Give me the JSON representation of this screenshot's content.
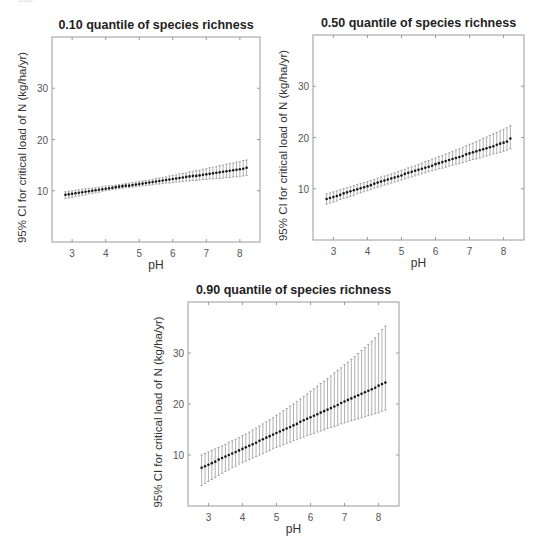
{
  "page": {
    "number_fragment": "560"
  },
  "chart_data": [
    {
      "type": "scatter",
      "subtype": "point-with-error-bars",
      "title": "0.10 quantile of species richness",
      "xlabel": "pH",
      "ylabel": "95% CI for critical load of N (kg/ha/yr)",
      "xlim": [
        2.4,
        8.6
      ],
      "ylim": [
        0,
        40
      ],
      "xticks": [
        3,
        4,
        5,
        6,
        7,
        8
      ],
      "yticks": [
        10,
        20,
        30
      ],
      "grid": false,
      "legend": null,
      "x": [
        2.8,
        2.9,
        3.0,
        3.1,
        3.2,
        3.3,
        3.4,
        3.5,
        3.6,
        3.7,
        3.8,
        3.9,
        4.0,
        4.1,
        4.2,
        4.3,
        4.4,
        4.5,
        4.6,
        4.7,
        4.8,
        4.9,
        5.0,
        5.1,
        5.2,
        5.3,
        5.4,
        5.5,
        5.6,
        5.7,
        5.8,
        5.9,
        6.0,
        6.1,
        6.2,
        6.3,
        6.4,
        6.5,
        6.6,
        6.7,
        6.8,
        6.9,
        7.0,
        7.1,
        7.2,
        7.3,
        7.4,
        7.5,
        7.6,
        7.7,
        7.8,
        7.9,
        8.0,
        8.1,
        8.2
      ],
      "series": [
        {
          "name": "estimate",
          "values": [
            9.2,
            9.3,
            9.4,
            9.5,
            9.6,
            9.7,
            9.8,
            9.9,
            10.0,
            10.1,
            10.2,
            10.3,
            10.4,
            10.5,
            10.6,
            10.7,
            10.8,
            10.9,
            11.0,
            11.0,
            11.1,
            11.2,
            11.3,
            11.4,
            11.5,
            11.6,
            11.7,
            11.8,
            11.9,
            12.0,
            12.1,
            12.2,
            12.3,
            12.4,
            12.5,
            12.6,
            12.7,
            12.8,
            12.9,
            12.9,
            13.0,
            13.1,
            13.2,
            13.3,
            13.4,
            13.5,
            13.6,
            13.7,
            13.8,
            13.9,
            14.0,
            14.1,
            14.2,
            14.3,
            14.5
          ]
        },
        {
          "name": "lower_95",
          "values": [
            8.5,
            8.6,
            8.7,
            8.9,
            9.0,
            9.1,
            9.2,
            9.4,
            9.5,
            9.6,
            9.7,
            9.9,
            10.0,
            10.1,
            10.2,
            10.3,
            10.4,
            10.5,
            10.6,
            10.6,
            10.7,
            10.8,
            10.9,
            11.0,
            11.0,
            11.1,
            11.2,
            11.3,
            11.3,
            11.4,
            11.5,
            11.5,
            11.6,
            11.7,
            11.7,
            11.8,
            11.9,
            11.9,
            12.0,
            12.0,
            12.1,
            12.2,
            12.2,
            12.3,
            12.3,
            12.4,
            12.4,
            12.5,
            12.6,
            12.6,
            12.7,
            12.7,
            12.8,
            12.9,
            13.0
          ]
        },
        {
          "name": "upper_95",
          "values": [
            9.8,
            9.9,
            10.0,
            10.1,
            10.2,
            10.3,
            10.4,
            10.5,
            10.5,
            10.6,
            10.7,
            10.8,
            10.9,
            11.0,
            11.0,
            11.1,
            11.2,
            11.3,
            11.4,
            11.5,
            11.6,
            11.7,
            11.8,
            11.9,
            12.0,
            12.1,
            12.2,
            12.4,
            12.5,
            12.6,
            12.7,
            12.9,
            13.0,
            13.1,
            13.3,
            13.4,
            13.5,
            13.7,
            13.8,
            13.9,
            14.0,
            14.2,
            14.3,
            14.5,
            14.6,
            14.7,
            14.9,
            15.0,
            15.2,
            15.3,
            15.4,
            15.6,
            15.7,
            15.9,
            16.0
          ]
        }
      ]
    },
    {
      "type": "scatter",
      "subtype": "point-with-error-bars",
      "title": "0.50 quantile of species richness",
      "xlabel": "pH",
      "ylabel": "95% CI for critical load of N (kg/ha/yr)",
      "xlim": [
        2.4,
        8.6
      ],
      "ylim": [
        0,
        40
      ],
      "xticks": [
        3,
        4,
        5,
        6,
        7,
        8
      ],
      "yticks": [
        10,
        20,
        30
      ],
      "grid": false,
      "legend": null,
      "x": [
        2.8,
        2.9,
        3.0,
        3.1,
        3.2,
        3.3,
        3.4,
        3.5,
        3.6,
        3.7,
        3.8,
        3.9,
        4.0,
        4.1,
        4.2,
        4.3,
        4.4,
        4.5,
        4.6,
        4.7,
        4.8,
        4.9,
        5.0,
        5.1,
        5.2,
        5.3,
        5.4,
        5.5,
        5.6,
        5.7,
        5.8,
        5.9,
        6.0,
        6.1,
        6.2,
        6.3,
        6.4,
        6.5,
        6.6,
        6.7,
        6.8,
        6.9,
        7.0,
        7.1,
        7.2,
        7.3,
        7.4,
        7.5,
        7.6,
        7.7,
        7.8,
        7.9,
        8.0,
        8.1,
        8.2
      ],
      "series": [
        {
          "name": "estimate",
          "values": [
            8.0,
            8.2,
            8.4,
            8.6,
            8.8,
            9.1,
            9.3,
            9.5,
            9.7,
            9.9,
            10.1,
            10.3,
            10.5,
            10.7,
            11.0,
            11.2,
            11.4,
            11.6,
            11.8,
            12.0,
            12.2,
            12.4,
            12.6,
            12.9,
            13.1,
            13.3,
            13.5,
            13.7,
            13.9,
            14.1,
            14.3,
            14.5,
            14.8,
            15.0,
            15.2,
            15.4,
            15.6,
            15.8,
            16.0,
            16.2,
            16.4,
            16.7,
            16.9,
            17.1,
            17.3,
            17.5,
            17.7,
            17.9,
            18.1,
            18.3,
            18.6,
            18.8,
            19.0,
            19.2,
            19.8
          ]
        },
        {
          "name": "lower_95",
          "values": [
            7.0,
            7.2,
            7.4,
            7.6,
            7.9,
            8.1,
            8.3,
            8.5,
            8.7,
            9.0,
            9.2,
            9.4,
            9.6,
            9.8,
            10.1,
            10.3,
            10.5,
            10.7,
            10.9,
            11.1,
            11.3,
            11.5,
            11.7,
            11.9,
            12.1,
            12.3,
            12.5,
            12.7,
            12.9,
            13.1,
            13.3,
            13.5,
            13.7,
            13.9,
            14.0,
            14.2,
            14.4,
            14.6,
            14.8,
            14.9,
            15.1,
            15.3,
            15.5,
            15.7,
            15.8,
            16.0,
            16.2,
            16.4,
            16.6,
            16.8,
            16.9,
            17.1,
            17.3,
            17.5,
            17.8
          ]
        },
        {
          "name": "upper_95",
          "values": [
            9.0,
            9.2,
            9.4,
            9.6,
            9.8,
            10.0,
            10.2,
            10.4,
            10.6,
            10.8,
            11.0,
            11.2,
            11.4,
            11.6,
            11.8,
            12.1,
            12.3,
            12.5,
            12.7,
            12.9,
            13.1,
            13.4,
            13.6,
            13.8,
            14.1,
            14.3,
            14.5,
            14.8,
            15.0,
            15.3,
            15.5,
            15.8,
            16.0,
            16.3,
            16.5,
            16.8,
            17.0,
            17.3,
            17.6,
            17.8,
            18.1,
            18.4,
            18.7,
            18.9,
            19.2,
            19.5,
            19.8,
            20.1,
            20.4,
            20.7,
            21.0,
            21.3,
            21.6,
            21.9,
            22.3
          ]
        }
      ]
    },
    {
      "type": "scatter",
      "subtype": "point-with-error-bars",
      "title": "0.90 quantile of species richness",
      "xlabel": "pH",
      "ylabel": "95% CI for critical load of N (kg/ha/yr)",
      "xlim": [
        2.4,
        8.6
      ],
      "ylim": [
        0,
        40
      ],
      "xticks": [
        3,
        4,
        5,
        6,
        7,
        8
      ],
      "yticks": [
        10,
        20,
        30
      ],
      "grid": false,
      "legend": null,
      "x": [
        2.8,
        2.9,
        3.0,
        3.1,
        3.2,
        3.3,
        3.4,
        3.5,
        3.6,
        3.7,
        3.8,
        3.9,
        4.0,
        4.1,
        4.2,
        4.3,
        4.4,
        4.5,
        4.6,
        4.7,
        4.8,
        4.9,
        5.0,
        5.1,
        5.2,
        5.3,
        5.4,
        5.5,
        5.6,
        5.7,
        5.8,
        5.9,
        6.0,
        6.1,
        6.2,
        6.3,
        6.4,
        6.5,
        6.6,
        6.7,
        6.8,
        6.9,
        7.0,
        7.1,
        7.2,
        7.3,
        7.4,
        7.5,
        7.6,
        7.7,
        7.8,
        7.9,
        8.0,
        8.1,
        8.2
      ],
      "series": [
        {
          "name": "estimate",
          "values": [
            7.5,
            7.8,
            8.1,
            8.4,
            8.7,
            9.1,
            9.4,
            9.7,
            10.0,
            10.3,
            10.6,
            10.9,
            11.2,
            11.5,
            11.8,
            12.1,
            12.4,
            12.8,
            13.1,
            13.4,
            13.7,
            14.0,
            14.3,
            14.6,
            14.9,
            15.2,
            15.5,
            15.8,
            16.1,
            16.5,
            16.8,
            17.1,
            17.4,
            17.7,
            18.0,
            18.3,
            18.6,
            18.9,
            19.2,
            19.5,
            19.8,
            20.2,
            20.5,
            20.8,
            21.1,
            21.4,
            21.7,
            22.0,
            22.3,
            22.6,
            22.9,
            23.2,
            23.6,
            23.9,
            24.2
          ]
        },
        {
          "name": "lower_95",
          "values": [
            4.0,
            4.4,
            4.8,
            5.2,
            5.6,
            6.0,
            6.4,
            6.8,
            7.1,
            7.5,
            7.8,
            8.2,
            8.5,
            8.8,
            9.1,
            9.4,
            9.7,
            10.0,
            10.3,
            10.6,
            10.9,
            11.2,
            11.5,
            11.7,
            12.0,
            12.3,
            12.5,
            12.8,
            13.0,
            13.3,
            13.5,
            13.8,
            14.0,
            14.2,
            14.5,
            14.7,
            14.9,
            15.2,
            15.4,
            15.6,
            15.8,
            16.1,
            16.3,
            16.5,
            16.7,
            16.9,
            17.1,
            17.3,
            17.5,
            17.7,
            17.9,
            18.1,
            18.3,
            18.6,
            18.8
          ]
        },
        {
          "name": "upper_95",
          "values": [
            10.0,
            10.3,
            10.6,
            10.9,
            11.2,
            11.5,
            11.8,
            12.1,
            12.5,
            12.8,
            13.1,
            13.4,
            13.8,
            14.1,
            14.5,
            14.9,
            15.3,
            15.7,
            16.1,
            16.5,
            16.9,
            17.3,
            17.8,
            18.2,
            18.7,
            19.1,
            19.6,
            20.0,
            20.5,
            21.0,
            21.5,
            22.0,
            22.5,
            23.0,
            23.5,
            24.0,
            24.5,
            25.0,
            25.5,
            26.1,
            26.6,
            27.1,
            27.7,
            28.2,
            28.8,
            29.3,
            29.9,
            30.5,
            31.1,
            31.7,
            32.3,
            33.0,
            33.8,
            34.6,
            35.3
          ]
        }
      ]
    }
  ],
  "colors": {
    "point": "#1a1a1a",
    "errorbar": "#7a7a7a",
    "axis": "#9a9a9a",
    "tick_label": "#555555",
    "title": "#222222"
  }
}
